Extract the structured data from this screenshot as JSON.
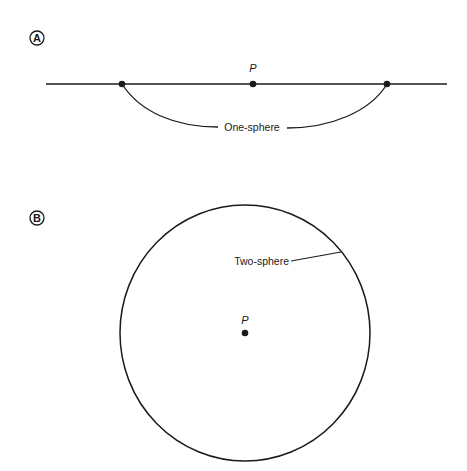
{
  "colors": {
    "ink": "#1a1a1a",
    "background": "#ffffff"
  },
  "panel_a": {
    "letter": "A",
    "point_label": "P",
    "curve_label": "One-sphere",
    "line": {
      "x1": 46,
      "y1": 84,
      "x2": 447,
      "y2": 84
    },
    "points": [
      {
        "name": "left-endpoint",
        "x": 122,
        "y": 84
      },
      {
        "name": "P",
        "x": 253,
        "y": 84
      },
      {
        "name": "right-endpoint",
        "x": 387,
        "y": 84
      }
    ]
  },
  "panel_b": {
    "letter": "B",
    "point_label": "P",
    "circle_label": "Two-sphere",
    "circle": {
      "cx": 245,
      "cy": 333,
      "rx": 125,
      "ry": 128
    },
    "center_point": {
      "x": 244,
      "y": 333
    }
  }
}
